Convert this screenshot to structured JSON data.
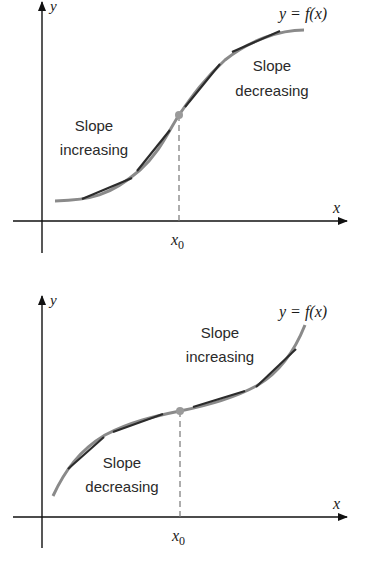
{
  "diagrams": [
    {
      "id": "top",
      "title": "Inflection point: slope increasing then decreasing",
      "axis_x_label": "x",
      "axis_y_label": "y",
      "function_label": "y = f(x)",
      "inflection_label": "x0",
      "inflection_label_base": "x",
      "inflection_label_sub": "0",
      "region_left": {
        "line1": "Slope",
        "line2": "increasing"
      },
      "region_right": {
        "line1": "Slope",
        "line2": "decreasing"
      }
    },
    {
      "id": "bottom",
      "title": "Inflection point: slope decreasing then increasing",
      "axis_x_label": "x",
      "axis_y_label": "y",
      "function_label": "y = f(x)",
      "inflection_label": "x0",
      "inflection_label_base": "x",
      "inflection_label_sub": "0",
      "region_left": {
        "line1": "Slope",
        "line2": "decreasing"
      },
      "region_right": {
        "line1": "Slope",
        "line2": "increasing"
      }
    }
  ],
  "colors": {
    "axis": "#111111",
    "curve": "#8a8a8a",
    "tangent": "#2b2b2b",
    "inflection_point": "#9a9a9a",
    "dashed_line": "#777777",
    "text": "#2a2a2a"
  }
}
